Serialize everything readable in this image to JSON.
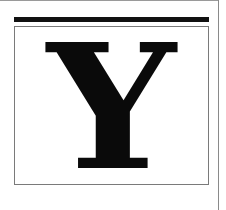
{
  "tile": {
    "letter": "Y",
    "colors": {
      "letter": "#0a0a0a",
      "bar": "#111111",
      "border": "#7a7a7a",
      "background": "#ffffff"
    }
  }
}
